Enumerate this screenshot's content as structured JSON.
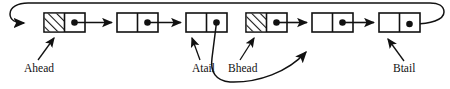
{
  "diagram": {
    "type": "linked-list-diagram",
    "colors": {
      "stroke": "#111111",
      "fill": "#ffffff",
      "hatch": "#111111",
      "background": "#ffffff"
    },
    "nodes": [
      {
        "id": "a-header",
        "index": 0,
        "x": 44,
        "y": 13,
        "w": 41,
        "h": 19,
        "left_cell": "hatched",
        "right_cell": "pointer-dot",
        "chain": "A"
      },
      {
        "id": "a-node-1",
        "index": 1,
        "x": 117,
        "y": 13,
        "w": 41,
        "h": 19,
        "left_cell": "empty",
        "right_cell": "pointer-dot",
        "chain": "A"
      },
      {
        "id": "a-node-2",
        "index": 2,
        "x": 186,
        "y": 13,
        "w": 41,
        "h": 19,
        "left_cell": "empty",
        "right_cell": "pointer-dot",
        "chain": "A"
      },
      {
        "id": "b-header",
        "index": 3,
        "x": 246,
        "y": 13,
        "w": 41,
        "h": 19,
        "left_cell": "hatched",
        "right_cell": "pointer-dot",
        "chain": "B"
      },
      {
        "id": "b-node-1",
        "index": 4,
        "x": 312,
        "y": 13,
        "w": 41,
        "h": 19,
        "left_cell": "empty",
        "right_cell": "pointer-dot",
        "chain": "B"
      },
      {
        "id": "b-node-2",
        "index": 5,
        "x": 379,
        "y": 13,
        "w": 41,
        "h": 19,
        "left_cell": "empty",
        "right_cell": "pointer-dot",
        "chain": "B"
      }
    ],
    "labels": [
      {
        "id": "ahead",
        "text": "Ahead",
        "x": 24,
        "y": 72,
        "points_to": "a-header",
        "arrow": "up-right"
      },
      {
        "id": "atail",
        "text": "Atail",
        "x": 192,
        "y": 72,
        "points_to": "a-node-2",
        "arrow": "up-right"
      },
      {
        "id": "bhead",
        "text": "Bhead",
        "x": 228,
        "y": 72,
        "points_to": "b-header",
        "arrow": "up-right"
      },
      {
        "id": "btail",
        "text": "Btail",
        "x": 393,
        "y": 72,
        "points_to": "b-node-2",
        "arrow": "up-left"
      }
    ],
    "links": [
      {
        "id": "a-wrap",
        "from": "b-node-2",
        "to": "a-header",
        "style": "curved-wrap-top",
        "description": "tail pointer loops over the top back to the A header"
      },
      {
        "id": "a-0-1",
        "from": "a-header",
        "to": "a-node-1",
        "style": "straight"
      },
      {
        "id": "a-1-2",
        "from": "a-node-1",
        "to": "a-node-2",
        "style": "straight"
      },
      {
        "id": "a-2-b1",
        "from": "a-node-2",
        "to": "b-node-1",
        "style": "curved-bottom",
        "description": "long curve dropping below the labels and rising into B's first node"
      },
      {
        "id": "b-0-1",
        "from": "b-header",
        "to": "b-node-1",
        "style": "straight"
      },
      {
        "id": "b-1-2",
        "from": "b-node-1",
        "to": "b-node-2",
        "style": "straight"
      }
    ]
  }
}
